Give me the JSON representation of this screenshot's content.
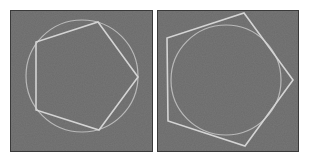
{
  "colors": {
    "page_bg": "#ffffff",
    "panel_bg": "#6b6b6b",
    "panel_border": "#3a3a3a",
    "polygon_stroke": "#d4d4d4",
    "circle_stroke": "#b9b9b9"
  },
  "panels": [
    {
      "id": "inscribed",
      "label": "Pentagon inscribed in circle",
      "rect": {
        "x": 10,
        "y": 10,
        "w": 143,
        "h": 142
      },
      "circle": {
        "cx": 82,
        "cy": 76,
        "r": 56
      },
      "pentagon": [
        [
          98,
          22
        ],
        [
          138,
          77
        ],
        [
          99,
          130
        ],
        [
          36,
          110
        ],
        [
          36,
          42
        ]
      ]
    },
    {
      "id": "circumscribed",
      "label": "Pentagon circumscribed about circle",
      "rect": {
        "x": 157,
        "y": 10,
        "w": 142,
        "h": 142
      },
      "circle": {
        "cx": 226,
        "cy": 80,
        "r": 55
      },
      "pentagon": [
        [
          244,
          13
        ],
        [
          293,
          80
        ],
        [
          245,
          146
        ],
        [
          168,
          121
        ],
        [
          167,
          38
        ]
      ]
    }
  ]
}
